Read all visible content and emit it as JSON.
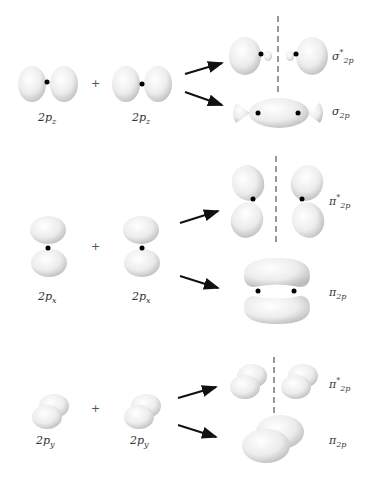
{
  "diagram": {
    "rows": [
      {
        "ao_label_left": "2p",
        "ao_sub_left": "z",
        "ao_label_right": "2p",
        "ao_sub_right": "z",
        "plus": "+",
        "antibonding": {
          "symbol": "σ",
          "sup": "*",
          "sub": "2p"
        },
        "bonding": {
          "symbol": "σ",
          "sub": "2p"
        }
      },
      {
        "ao_label_left": "2p",
        "ao_sub_left": "x",
        "ao_label_right": "2p",
        "ao_sub_right": "x",
        "plus": "+",
        "antibonding": {
          "symbol": "π",
          "sup": "*",
          "sub": "2p"
        },
        "bonding": {
          "symbol": "π",
          "sub": "2p"
        }
      },
      {
        "ao_label_left": "2p",
        "ao_sub_left": "y",
        "ao_label_right": "2p",
        "ao_sub_right": "y",
        "plus": "+",
        "antibonding": {
          "symbol": "π",
          "sup": "*",
          "sub": "2p"
        },
        "bonding": {
          "symbol": "π",
          "sub": "2p"
        }
      }
    ],
    "colors": {
      "lobe": "#e6e6e6",
      "lobe_edge": "#c8c8c8",
      "nucleus": "#000000",
      "arrow": "#111111",
      "node_line": "#333333"
    }
  }
}
